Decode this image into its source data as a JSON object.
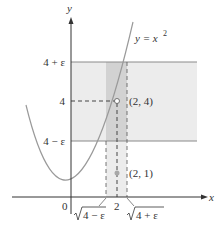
{
  "diagram": {
    "type": "epsilon-neighborhood plot",
    "function_label": "y = x²",
    "function_label_base": "y = x",
    "function_label_exp": "2",
    "axes": {
      "x_label": "x",
      "y_label": "y",
      "origin_label": "0"
    },
    "y_ticks": [
      {
        "label": "4 + ε",
        "value": "4+eps"
      },
      {
        "label": "4",
        "value": 4
      },
      {
        "label": "4 − ε",
        "value": "4-eps"
      }
    ],
    "x_ticks": [
      {
        "label": "√4 − ε",
        "radicand": "4 − ε",
        "value": "sqrt(4-eps)"
      },
      {
        "label": "2",
        "value": 2
      },
      {
        "label": "√4 + ε",
        "radicand": "4 + ε",
        "value": "sqrt(4+eps)"
      }
    ],
    "points": [
      {
        "label": "(2, 4)",
        "x": 2,
        "y": 4,
        "style": "open-circle"
      },
      {
        "label": "(2, 1)",
        "x": 2,
        "y": 1,
        "style": "filled-gray"
      }
    ],
    "colors": {
      "axis": "#333333",
      "curve": "#9a9a9a",
      "band_light": "#ececec",
      "band_dark": "#d2d2d2",
      "band_edge": "#8a8a8a",
      "dashes": "#444444",
      "point_gray": "#a8a8a8"
    }
  }
}
